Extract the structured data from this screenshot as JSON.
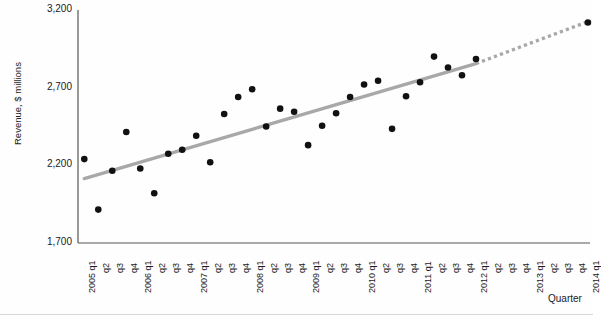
{
  "chart_data": {
    "type": "scatter",
    "title": "",
    "xlabel": "Quarter",
    "ylabel": "Revenue, $ millions",
    "ylim": [
      1700,
      3200
    ],
    "yticks": [
      1700,
      2200,
      2700,
      3200
    ],
    "ytick_labels": [
      "1,700",
      "2,200",
      "2,700",
      "3,200"
    ],
    "grid": false,
    "legend": "none",
    "categories": [
      "2005 q1",
      "q2",
      "q3",
      "q4",
      "2006 q1",
      "q2",
      "q3",
      "q4",
      "2007 q1",
      "q2",
      "q3",
      "q4",
      "2008 q1",
      "q2",
      "q3",
      "q4",
      "2009 q1",
      "q2",
      "q3",
      "q4",
      "2010 q1",
      "q2",
      "q3",
      "q4",
      "2011 q1",
      "q2",
      "q3",
      "q4",
      "2012 q1",
      "q2",
      "q3",
      "q4",
      "2013 q1",
      "q2",
      "q3",
      "q4",
      "2014 q1"
    ],
    "series": [
      {
        "name": "Revenue",
        "marker": "filled-circle",
        "color": "#111111",
        "points": [
          {
            "x": "2005 q1",
            "xi": 0,
            "y": 2240
          },
          {
            "x": "2005 q2",
            "xi": 1,
            "y": 1915
          },
          {
            "x": "2005 q3",
            "xi": 2,
            "y": 2165
          },
          {
            "x": "2005 q4",
            "xi": 3,
            "y": 2415
          },
          {
            "x": "2006 q1",
            "xi": 4,
            "y": 2180
          },
          {
            "x": "2006 q2",
            "xi": 5,
            "y": 2020
          },
          {
            "x": "2006 q3",
            "xi": 6,
            "y": 2275
          },
          {
            "x": "2006 q4",
            "xi": 7,
            "y": 2300
          },
          {
            "x": "2007 q1",
            "xi": 8,
            "y": 2390
          },
          {
            "x": "2007 q2",
            "xi": 9,
            "y": 2220
          },
          {
            "x": "2007 q3",
            "xi": 10,
            "y": 2530
          },
          {
            "x": "2007 q4",
            "xi": 11,
            "y": 2640
          },
          {
            "x": "2008 q1",
            "xi": 12,
            "y": 2690
          },
          {
            "x": "2008 q2",
            "xi": 13,
            "y": 2450
          },
          {
            "x": "2008 q3",
            "xi": 14,
            "y": 2565
          },
          {
            "x": "2008 q4",
            "xi": 15,
            "y": 2545
          },
          {
            "x": "2009 q1",
            "xi": 16,
            "y": 2330
          },
          {
            "x": "2009 q2",
            "xi": 17,
            "y": 2455
          },
          {
            "x": "2009 q3",
            "xi": 18,
            "y": 2535
          },
          {
            "x": "2009 q4",
            "xi": 19,
            "y": 2640
          },
          {
            "x": "2010 q1",
            "xi": 20,
            "y": 2720
          },
          {
            "x": "2010 q2",
            "xi": 21,
            "y": 2745
          },
          {
            "x": "2010 q3",
            "xi": 22,
            "y": 2435
          },
          {
            "x": "2010 q4",
            "xi": 23,
            "y": 2645
          },
          {
            "x": "2011 q1",
            "xi": 24,
            "y": 2735
          },
          {
            "x": "2011 q2",
            "xi": 25,
            "y": 2900
          },
          {
            "x": "2011 q3",
            "xi": 26,
            "y": 2830
          },
          {
            "x": "2011 q4",
            "xi": 27,
            "y": 2780
          },
          {
            "x": "2012 q1",
            "xi": 28,
            "y": 2885
          },
          {
            "x": "2014 q1",
            "xi": 36,
            "y": 3120
          }
        ]
      }
    ],
    "trendline": {
      "name": "Linear trend",
      "color": "#a8a8a8",
      "solid_from": {
        "xi": 0,
        "y": 2115
      },
      "solid_to": {
        "xi": 28,
        "y": 2855
      },
      "dotted_from": {
        "xi": 28,
        "y": 2855
      },
      "dotted_to": {
        "xi": 36,
        "y": 3125
      },
      "style_solid": "solid",
      "style_extension": "dotted"
    }
  },
  "axes": {
    "y_axis_title": "Revenue, $ millions",
    "x_axis_title": "Quarter"
  }
}
